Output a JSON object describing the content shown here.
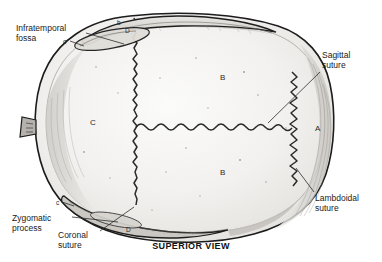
{
  "figure": {
    "caption": "SUPERIOR VIEW",
    "view": "superior",
    "render_colors": {
      "background": "#ffffff",
      "outline": "#1a1a1a",
      "bone_fill": "#f0efed",
      "bone_shadow": "#d8d6d2",
      "suture_line": "#262626",
      "leader_line": "#333333",
      "text": "#1a1a1a"
    }
  },
  "annotations": [
    {
      "id": "infratemporal-fossa",
      "text": "Infratemporal\nfossa",
      "x": 16,
      "y": 23,
      "leader": {
        "x1": 86,
        "y1": 33,
        "x2": 124,
        "y2": 44
      }
    },
    {
      "id": "sagittal-suture",
      "text": "Sagittal\nsuture",
      "x": 322,
      "y": 50,
      "leader": {
        "x1": 320,
        "y1": 72,
        "x2": 268,
        "y2": 123
      }
    },
    {
      "id": "lambdoidal-suture",
      "text": "Lambdoidal\nsuture",
      "x": 315,
      "y": 193,
      "leader": {
        "x1": 314,
        "y1": 192,
        "x2": 296,
        "y2": 168
      }
    },
    {
      "id": "zygomatic-process",
      "text": "Zygomatic\nprocess",
      "x": 12,
      "y": 213,
      "leader": {
        "x1": 72,
        "y1": 217,
        "x2": 118,
        "y2": 222
      }
    },
    {
      "id": "coronal-suture",
      "text": "Coronal\nsuture",
      "x": 58,
      "y": 230,
      "leader": {
        "x1": 100,
        "y1": 231,
        "x2": 134,
        "y2": 207
      }
    }
  ],
  "bone_markers": [
    {
      "id": "marker-b-upper",
      "label": "B",
      "x": 220,
      "y": 73,
      "size": "normal"
    },
    {
      "id": "marker-b-lower",
      "label": "B",
      "x": 220,
      "y": 168,
      "size": "normal"
    },
    {
      "id": "marker-c-parietal",
      "label": "C",
      "x": 90,
      "y": 118,
      "size": "normal"
    },
    {
      "id": "marker-a-occipital",
      "label": "A",
      "x": 315,
      "y": 124,
      "size": "normal"
    },
    {
      "id": "marker-d-top",
      "label": "D",
      "x": 125,
      "y": 27,
      "size": "small"
    },
    {
      "id": "marker-d-bottom",
      "label": "D",
      "x": 126,
      "y": 226,
      "size": "small"
    },
    {
      "id": "marker-c-top",
      "label": "c",
      "x": 63,
      "y": 38,
      "size": "small"
    },
    {
      "id": "marker-c-bottom",
      "label": "c",
      "x": 56,
      "y": 199,
      "size": "small"
    },
    {
      "id": "marker-b-top-edge",
      "label": "b",
      "x": 117,
      "y": 19,
      "size": "small"
    }
  ]
}
